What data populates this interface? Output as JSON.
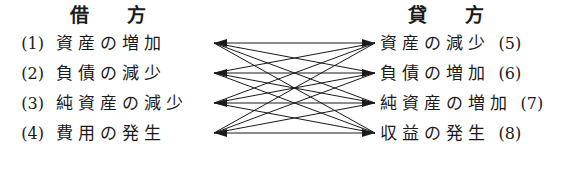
{
  "headers": {
    "debit": {
      "char1": "借",
      "char2": "方"
    },
    "credit": {
      "char1": "貸",
      "char2": "方"
    }
  },
  "left_entries": [
    {
      "number": "(1)",
      "term": "資産の増加"
    },
    {
      "number": "(2)",
      "term": "負債の減少"
    },
    {
      "number": "(3)",
      "term": "純資産の減少"
    },
    {
      "number": "(4)",
      "term": "費用の発生"
    }
  ],
  "right_entries": [
    {
      "term": "資産の減少",
      "number": "(5)"
    },
    {
      "term": "負債の増加",
      "number": "(6)"
    },
    {
      "term": "純資産の増加",
      "number": "(7)"
    },
    {
      "term": "収益の発生",
      "number": "(8)"
    }
  ],
  "diagram": {
    "type": "bipartite-graph",
    "left_node_x": 214,
    "right_node_x": 375,
    "node_rows_y": [
      43,
      73,
      103,
      133
    ],
    "edge_color": "#1a1a1a",
    "edge_count": 16,
    "edges": [
      [
        0,
        0
      ],
      [
        0,
        1
      ],
      [
        0,
        2
      ],
      [
        0,
        3
      ],
      [
        1,
        0
      ],
      [
        1,
        1
      ],
      [
        1,
        2
      ],
      [
        1,
        3
      ],
      [
        2,
        0
      ],
      [
        2,
        1
      ],
      [
        2,
        2
      ],
      [
        2,
        3
      ],
      [
        3,
        0
      ],
      [
        3,
        1
      ],
      [
        3,
        2
      ],
      [
        3,
        3
      ]
    ]
  }
}
